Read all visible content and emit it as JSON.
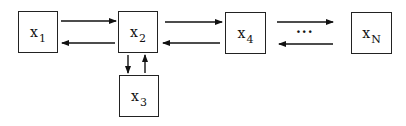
{
  "diagram": {
    "nodes": [
      {
        "id": "x1",
        "base": "x",
        "sub": "1"
      },
      {
        "id": "x2",
        "base": "x",
        "sub": "2"
      },
      {
        "id": "x3",
        "base": "x",
        "sub": "3"
      },
      {
        "id": "x4",
        "base": "x",
        "sub": "4"
      },
      {
        "id": "xN",
        "base": "x",
        "sub": "N"
      }
    ],
    "ellipsis": "···",
    "edges": [
      {
        "from": "x1",
        "to": "x2"
      },
      {
        "from": "x2",
        "to": "x1"
      },
      {
        "from": "x2",
        "to": "x4"
      },
      {
        "from": "x4",
        "to": "x2"
      },
      {
        "from": "x2",
        "to": "x3"
      },
      {
        "from": "x3",
        "to": "x2"
      },
      {
        "from": "x4",
        "to": "xN"
      },
      {
        "from": "xN",
        "to": "x4"
      }
    ]
  }
}
